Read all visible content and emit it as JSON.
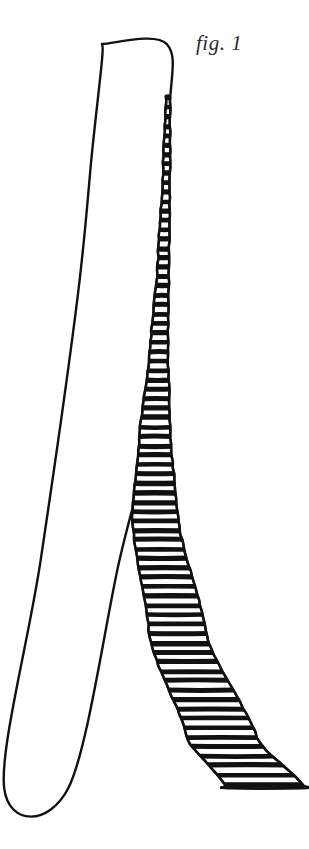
{
  "figure": {
    "caption": "fig. 1",
    "medium": "pen-and-ink line drawing",
    "background_color": "#ffffff",
    "ink_color": "#111111",
    "caption_color": "#2b2a28",
    "canvas": {
      "width": 309,
      "height": 849
    }
  },
  "shapes": {
    "plain_band": {
      "label": "plain-band",
      "description": "unhatched white strip, outlined in ink, running from top rectangle down to lower left",
      "fill": "#ffffff",
      "stroke": "#111111",
      "stroke_width": 2.4,
      "outline_points": "102,44 168,44 168,120 160,300 150,430 120,560 68,788 5,788 40,560 78,300 92,150 102,60"
    },
    "hatched_band": {
      "label": "hatched-band",
      "description": "ruled strip, very narrow at top and widening as it curves right and down",
      "fill": "#ffffff",
      "stroke": "#111111",
      "stroke_width": 2.4,
      "hatch_color": "#111111",
      "hatch_line_height": 5,
      "hatch_gap": 4.4,
      "hatch_count": 74,
      "left_edge_points": "166,96 163,170 158,260 150,350 140,430 132,520 150,640 188,740 227,788",
      "right_edge_points": "170,96 170,170 169,260 168,350 170,430 178,520 208,640 258,740 305,788"
    }
  },
  "geometry": {
    "top_rectangle": {
      "x": 102,
      "y": 44,
      "width": 66,
      "height": 56
    },
    "crossing_vertex": {
      "x": 129,
      "y": 434
    },
    "baseline_y": 788,
    "plain_band_bottom": {
      "x_left": 5,
      "x_right": 68
    },
    "hatched_band_bottom": {
      "x_left": 227,
      "x_right": 305
    }
  }
}
